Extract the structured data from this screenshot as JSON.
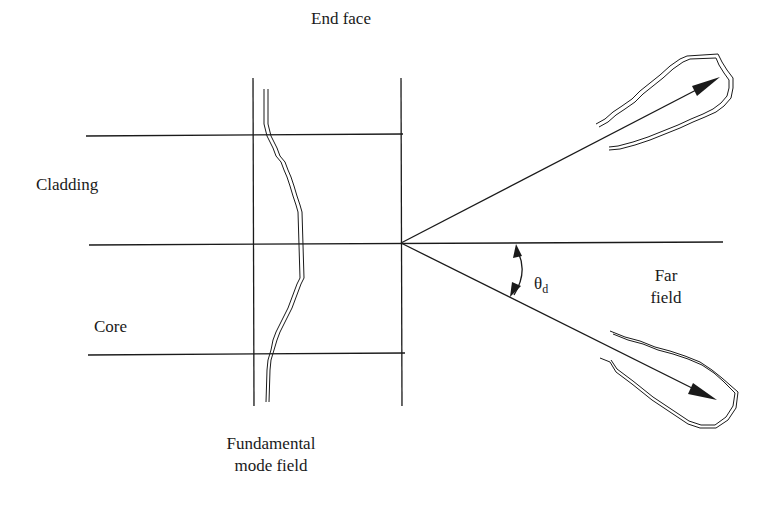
{
  "diagram": {
    "type": "optical-fiber-far-field",
    "labels": {
      "end_face": "End face",
      "cladding": "Cladding",
      "core": "Core",
      "mode_field_line1": "Fundamental",
      "mode_field_line2": "mode field",
      "theta_symbol": "θ",
      "theta_subscript": "d",
      "far_field_line1": "Far",
      "far_field_line2": "field"
    },
    "colors": {
      "stroke": "#1a1a1a",
      "background": "#ffffff"
    }
  }
}
